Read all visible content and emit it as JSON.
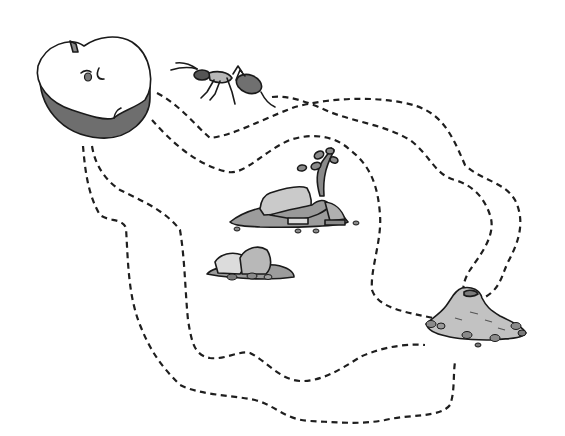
{
  "elements": {
    "apple": {
      "label": "Apple half",
      "role": "start"
    },
    "ant": {
      "label": "Ant"
    },
    "plant_rocks": {
      "label": "Rock pile with sprout"
    },
    "small_rocks": {
      "label": "Small rock pile"
    },
    "anthill": {
      "label": "Anthill",
      "role": "goal"
    }
  },
  "paths": [
    {
      "id": "path-1",
      "label": "Path from ant to anthill (top)"
    },
    {
      "id": "path-2",
      "label": "Path from apple to anthill (upper)"
    },
    {
      "id": "path-3",
      "label": "Path from apple to anthill (middle)"
    },
    {
      "id": "path-4",
      "label": "Path from apple to anthill (lower)"
    },
    {
      "id": "path-5",
      "label": "Path from apple to anthill (bottom)"
    }
  ],
  "colors": {
    "background": "#ffffff",
    "ink": "#1a1a1a",
    "apple_flesh": "#ffffff",
    "apple_skin": "#6e6e6e",
    "rock_light": "#c8c8c8",
    "rock_mid": "#a6a6a6",
    "rock_dark": "#808080",
    "dirt": "#bdbdbd"
  }
}
